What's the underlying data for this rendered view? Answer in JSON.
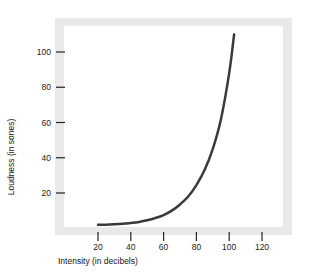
{
  "figure": {
    "title_remnant": "",
    "background_color": "#ffffff",
    "frame_color": "#e9e9e9",
    "plot_background": "#ffffff"
  },
  "chart_data": {
    "type": "line",
    "title": "",
    "xlabel": "Intensity (in decibels)",
    "ylabel": "Loudness (in sones)",
    "xlim": [
      10,
      135
    ],
    "ylim": [
      0,
      118
    ],
    "grid": false,
    "legend": null,
    "line_color": "#3a3a3a",
    "line_width": 2.5,
    "xticks": [
      20,
      40,
      60,
      80,
      100,
      120
    ],
    "xtick_labels": [
      "20",
      "40",
      "60",
      "80",
      "100",
      "120"
    ],
    "yticks": [
      20,
      40,
      60,
      80,
      100
    ],
    "ytick_labels": [
      "20",
      "40",
      "60",
      "80",
      "100"
    ],
    "series": [
      {
        "name": "Loudness",
        "x": [
          20,
          25,
          30,
          35,
          40,
          45,
          50,
          55,
          60,
          65,
          70,
          75,
          80,
          85,
          90,
          95,
          100,
          103
        ],
        "y": [
          2,
          2,
          2.2,
          2.5,
          3,
          3.6,
          4.5,
          5.8,
          7.5,
          10,
          13.5,
          18,
          24.5,
          33,
          45,
          62,
          88,
          110
        ]
      }
    ]
  }
}
